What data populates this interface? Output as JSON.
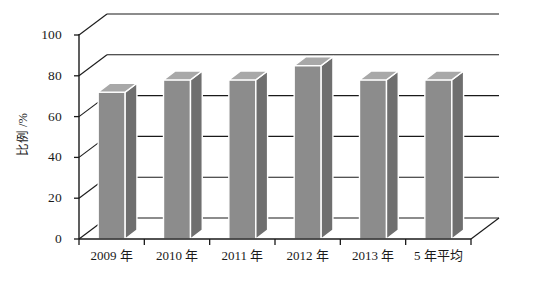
{
  "chart_data": {
    "type": "bar",
    "title": "",
    "subtitle": "",
    "xlabel": "",
    "ylabel": "比例 /%",
    "categories": [
      "2009 年",
      "2010 年",
      "2011 年",
      "2012 年",
      "2013 年",
      "5 年平均"
    ],
    "values": [
      72,
      78,
      78,
      85,
      78,
      78
    ],
    "series": [
      {
        "name": "比例",
        "values": [
          72,
          78,
          78,
          85,
          78,
          78
        ]
      }
    ],
    "ylim": [
      0,
      100
    ],
    "yticks": [
      0,
      20,
      40,
      60,
      80,
      100
    ],
    "ytick_labels": [
      "0",
      "20",
      "40",
      "60",
      "80",
      "100"
    ],
    "grid": "horizontal",
    "legend": "none",
    "style": "3d-columns",
    "annotations": [],
    "colors": {
      "bar_front": "#8c8c8c",
      "bar_top": "#a8a8a8",
      "bar_side": "#6f6f6f",
      "bar_outline": "#ffffff",
      "axis": "#1a1a1a",
      "gridline": "#1a1a1a",
      "background": "#ffffff",
      "floor": "#ffffff"
    }
  }
}
